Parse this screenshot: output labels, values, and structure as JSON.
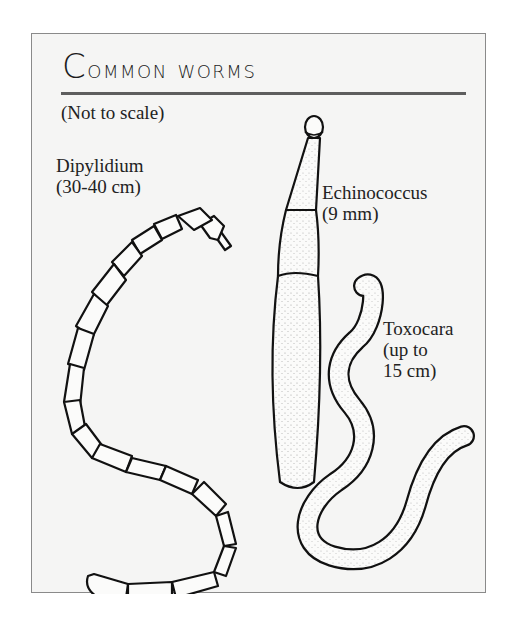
{
  "figure": {
    "title": "Common worms",
    "title_first_letter": "C",
    "title_rest": "ommon worms",
    "subtitle": "(Not to scale)",
    "colors": {
      "frame_border": "#8a8a8a",
      "frame_background": "#f5f5f4",
      "rule": "#5e5e5e",
      "ink": "#1a1a1a"
    },
    "worms": [
      {
        "name": "Dipylidium",
        "size": "(30-40 cm)",
        "label": "Dipylidium\n(30-40 cm)",
        "illustration": "segmented-tapeworm-s-curve"
      },
      {
        "name": "Echinococcus",
        "size": "(9 mm)",
        "label": "Echinococcus\n(9 mm)",
        "illustration": "short-segmented-tapeworm-vertical"
      },
      {
        "name": "Toxocara",
        "size": "(up to 15 cm)",
        "label": "Toxocara\n(up to\n15 cm)",
        "illustration": "roundworm-wavy"
      }
    ]
  }
}
